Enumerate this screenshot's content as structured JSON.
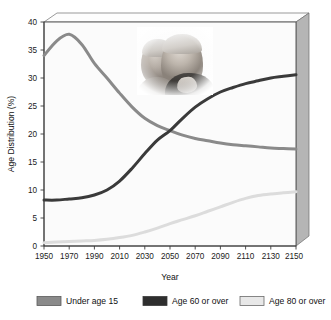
{
  "figure": {
    "background_color": "#ffffff",
    "plot_background_color": "#fbfbfb",
    "frame_color": "#4a4a4a",
    "side_panel_color": "#b8b8b8"
  },
  "inset_image": {
    "name": "elderly-couple-photo",
    "description": "Grayscale photograph of two elderly people"
  },
  "chart_data": {
    "type": "line",
    "title": "",
    "xlabel": "Year",
    "ylabel": "Age Distribution (%)",
    "xlim": [
      1950,
      2150
    ],
    "ylim": [
      0,
      40
    ],
    "xticks": [
      1950,
      1970,
      1990,
      2010,
      2030,
      2050,
      2070,
      2090,
      2110,
      2130,
      2150
    ],
    "yticks": [
      0,
      5,
      10,
      15,
      20,
      25,
      30,
      35,
      40
    ],
    "grid": false,
    "legend_position": "below",
    "x": [
      1950,
      1960,
      1970,
      1980,
      1990,
      2000,
      2010,
      2020,
      2030,
      2040,
      2050,
      2060,
      2070,
      2080,
      2090,
      2100,
      2110,
      2120,
      2130,
      2140,
      2150
    ],
    "series": [
      {
        "name": "Under age 15",
        "color": "#8a8a8a",
        "values": [
          34.0,
          36.6,
          37.8,
          36.0,
          32.6,
          30.0,
          27.3,
          24.8,
          22.8,
          21.5,
          20.6,
          19.8,
          19.2,
          18.8,
          18.4,
          18.1,
          17.9,
          17.7,
          17.5,
          17.4,
          17.3
        ]
      },
      {
        "name": "Age 60 or over",
        "color": "#3a3a3a",
        "values": [
          8.2,
          8.2,
          8.4,
          8.6,
          9.1,
          10.0,
          11.6,
          13.9,
          16.5,
          18.9,
          20.6,
          22.8,
          24.8,
          26.3,
          27.5,
          28.3,
          29.0,
          29.5,
          30.0,
          30.3,
          30.6
        ]
      },
      {
        "name": "Age 80 or over",
        "color": "#dcdcdc",
        "values": [
          0.6,
          0.7,
          0.8,
          0.9,
          1.0,
          1.2,
          1.5,
          1.9,
          2.5,
          3.2,
          4.0,
          4.7,
          5.4,
          6.2,
          7.0,
          7.8,
          8.5,
          9.0,
          9.3,
          9.5,
          9.7
        ]
      }
    ]
  },
  "legend": {
    "items": [
      {
        "label": "Under age 15",
        "color": "#8a8a8a"
      },
      {
        "label": "Age 60 or over",
        "color": "#2e2e2e"
      },
      {
        "label": "Age 80 or over",
        "color": "#e8e8e8"
      }
    ]
  }
}
